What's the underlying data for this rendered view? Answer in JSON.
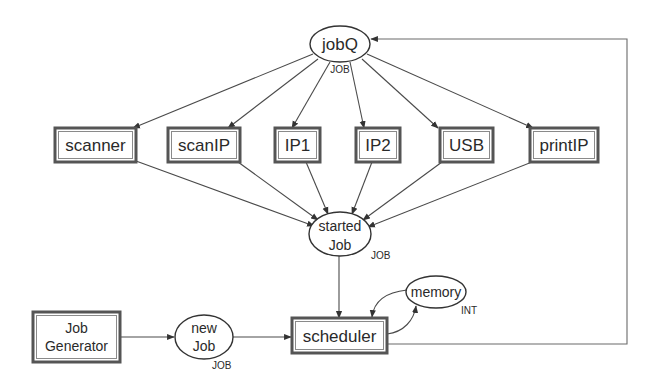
{
  "diagram": {
    "type": "petri-net",
    "colors": {
      "edge": "#4a4a4a",
      "box_border": "#555555",
      "place_border": "#333333",
      "text": "#2a2a2a",
      "background": "#ffffff"
    },
    "places": [
      {
        "id": "jobQ",
        "label": "jobQ",
        "type": "JOB"
      },
      {
        "id": "startedJob",
        "label_line1": "started",
        "label_line2": "Job",
        "type": "JOB"
      },
      {
        "id": "newJob",
        "label_line1": "new",
        "label_line2": "Job",
        "type": "JOB"
      },
      {
        "id": "memory",
        "label": "memory",
        "type": "INT"
      }
    ],
    "transitions": [
      {
        "id": "scanner",
        "label": "scanner"
      },
      {
        "id": "scanIP",
        "label": "scanIP"
      },
      {
        "id": "IP1",
        "label": "IP1"
      },
      {
        "id": "IP2",
        "label": "IP2"
      },
      {
        "id": "USB",
        "label": "USB"
      },
      {
        "id": "printIP",
        "label": "printIP"
      },
      {
        "id": "scheduler",
        "label": "scheduler"
      },
      {
        "id": "jobGenerator",
        "label_line1": "Job",
        "label_line2": "Generator"
      }
    ],
    "arcs": [
      {
        "from": "jobQ",
        "to": "scanner"
      },
      {
        "from": "jobQ",
        "to": "scanIP"
      },
      {
        "from": "jobQ",
        "to": "IP1"
      },
      {
        "from": "jobQ",
        "to": "IP2"
      },
      {
        "from": "jobQ",
        "to": "USB"
      },
      {
        "from": "jobQ",
        "to": "printIP"
      },
      {
        "from": "scanner",
        "to": "startedJob"
      },
      {
        "from": "scanIP",
        "to": "startedJob"
      },
      {
        "from": "IP1",
        "to": "startedJob"
      },
      {
        "from": "IP2",
        "to": "startedJob"
      },
      {
        "from": "USB",
        "to": "startedJob"
      },
      {
        "from": "printIP",
        "to": "startedJob"
      },
      {
        "from": "startedJob",
        "to": "scheduler"
      },
      {
        "from": "jobGenerator",
        "to": "newJob"
      },
      {
        "from": "newJob",
        "to": "scheduler"
      },
      {
        "from": "memory",
        "to": "scheduler"
      },
      {
        "from": "scheduler",
        "to": "memory"
      },
      {
        "from": "scheduler",
        "to": "jobQ"
      }
    ]
  }
}
